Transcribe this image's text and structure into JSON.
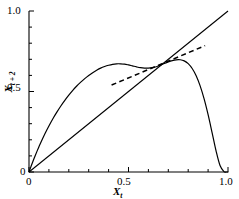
{
  "chart_data": {
    "type": "line",
    "title": "",
    "xlabel": "X_t",
    "ylabel": "X_{t+2}",
    "xlim": [
      0,
      1
    ],
    "ylim": [
      0,
      1
    ],
    "grid": false,
    "legend": null,
    "x_ticks_major": [
      0,
      0.5,
      1.0
    ],
    "x_tick_labels": [
      "0",
      "0.5",
      "1.0"
    ],
    "y_ticks_major": [
      0,
      0.5,
      1.0
    ],
    "y_tick_labels": [
      "0",
      "0.5",
      "1.0"
    ],
    "x_minor_tick_count": 10,
    "y_minor_tick_count": 10,
    "series": [
      {
        "name": "second-iterate-map",
        "style": "solid",
        "color": "#000000",
        "x": [
          0.0,
          0.01,
          0.02,
          0.03,
          0.04,
          0.05,
          0.06,
          0.08,
          0.1,
          0.12,
          0.14,
          0.16,
          0.18,
          0.2,
          0.22,
          0.24,
          0.26,
          0.28,
          0.3,
          0.32,
          0.34,
          0.36,
          0.38,
          0.4,
          0.42,
          0.44,
          0.46,
          0.48,
          0.5,
          0.52,
          0.54,
          0.56,
          0.58,
          0.6,
          0.62,
          0.64,
          0.66,
          0.68,
          0.7,
          0.72,
          0.74,
          0.76,
          0.78,
          0.8,
          0.82,
          0.84,
          0.86,
          0.88,
          0.9,
          0.92,
          0.94,
          0.96,
          0.98,
          0.99,
          1.0
        ],
        "y": [
          0.0,
          0.034,
          0.067,
          0.098,
          0.128,
          0.157,
          0.185,
          0.238,
          0.286,
          0.331,
          0.372,
          0.41,
          0.445,
          0.477,
          0.507,
          0.534,
          0.558,
          0.58,
          0.6,
          0.617,
          0.632,
          0.645,
          0.655,
          0.663,
          0.669,
          0.672,
          0.672,
          0.67,
          0.665,
          0.659,
          0.653,
          0.648,
          0.645,
          0.645,
          0.648,
          0.654,
          0.663,
          0.674,
          0.684,
          0.692,
          0.697,
          0.697,
          0.69,
          0.673,
          0.643,
          0.598,
          0.535,
          0.454,
          0.356,
          0.245,
          0.131,
          0.04,
          0.002,
          0.0,
          0.0
        ]
      },
      {
        "name": "identity-line",
        "style": "solid",
        "color": "#000000",
        "x": [
          0.0,
          1.0
        ],
        "y": [
          0.0,
          1.0
        ]
      },
      {
        "name": "tangent-line",
        "style": "dashed",
        "color": "#000000",
        "x": [
          0.415,
          0.885
        ],
        "y": [
          0.54,
          0.785
        ]
      }
    ],
    "annotations": []
  },
  "axes": {
    "x_title": "X",
    "x_title_sub": "t",
    "y_title": "X",
    "y_title_sub": "t + 2",
    "tick_labels": {
      "x": [
        "0",
        "0.5",
        "1.0"
      ],
      "y": [
        "0",
        "0.5",
        "1.0"
      ]
    }
  },
  "style": {
    "axis_color": "#000000",
    "curve_color": "#000000",
    "background": "#ffffff"
  }
}
